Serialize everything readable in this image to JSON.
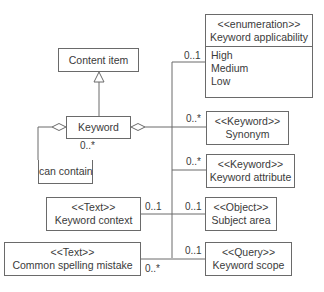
{
  "diagram": {
    "type": "UML class diagram",
    "classes": {
      "content_item": {
        "name": "Content item"
      },
      "keyword": {
        "name": "Keyword"
      },
      "can_contain": {
        "label": "can contain"
      },
      "keyword_applicability": {
        "stereotype": "<<enumeration>>",
        "name": "Keyword applicability",
        "values": [
          "High",
          "Medium",
          "Low"
        ]
      },
      "synonym": {
        "stereotype": "<<Keyword>>",
        "name": "Synonym"
      },
      "keyword_attribute": {
        "stereotype": "<<Keyword>>",
        "name": "Keyword attribute"
      },
      "subject_area": {
        "stereotype": "<<Object>>",
        "name": "Subject area"
      },
      "keyword_scope": {
        "stereotype": "<<Query>>",
        "name": "Keyword scope"
      },
      "keyword_context": {
        "stereotype": "<<Text>>",
        "name": "Keyword context"
      },
      "common_spelling_mistake": {
        "stereotype": "<<Text>>",
        "name": "Common spelling mistake"
      }
    },
    "multiplicities": {
      "self_loop": "0..*",
      "keyword_applicability": "0..1",
      "synonym": "0..*",
      "keyword_attribute": "0..*",
      "subject_area": "0..1",
      "keyword_context": "0..1",
      "keyword_scope": "0..1",
      "common_spelling_mistake": "0..*"
    },
    "colors": {
      "line": "#6a6a6a",
      "text": "#3a3a3a",
      "background": "#ffffff"
    }
  }
}
